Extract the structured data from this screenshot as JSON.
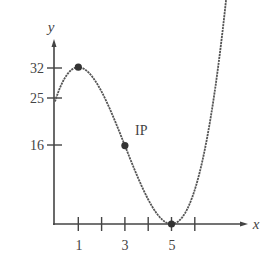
{
  "chart_data": {
    "type": "line",
    "title": "",
    "xlabel": "x",
    "ylabel": "y",
    "function": "f(x) = x^3 - 9x^2 + 15x + 25",
    "x_ticks": [
      1,
      2,
      3,
      4,
      5,
      6
    ],
    "x_tick_labels": [
      "1",
      "3",
      "5"
    ],
    "x_tick_label_values": [
      1,
      3,
      5
    ],
    "y_tick_labels": [
      "32",
      "25",
      "16"
    ],
    "y_tick_values": [
      32,
      25,
      16
    ],
    "xlim": [
      0,
      7.8
    ],
    "ylim": [
      0,
      37
    ],
    "grid": false,
    "legend": null,
    "series": [
      {
        "name": "f(x)",
        "x": [
          0,
          0.5,
          1,
          1.5,
          2,
          2.5,
          3,
          3.5,
          4,
          4.5,
          5,
          5.5,
          6,
          6.5,
          7,
          7.5
        ],
        "y": [
          25,
          30.375,
          32,
          30.625,
          27,
          21.875,
          16,
          10.125,
          5,
          1.375,
          0,
          1.625,
          7,
          16.875,
          32,
          53.125
        ]
      }
    ],
    "marked_points": [
      {
        "x": 1,
        "y": 32,
        "label": ""
      },
      {
        "x": 3,
        "y": 16,
        "label": "IP"
      },
      {
        "x": 5,
        "y": 0,
        "label": ""
      }
    ],
    "annotations": [
      {
        "text": "IP",
        "x": 3,
        "y": 16
      }
    ]
  },
  "labels": {
    "x_axis": "x",
    "y_axis": "y",
    "ip": "IP",
    "xt1": "1",
    "xt3": "3",
    "xt5": "5",
    "y32": "32",
    "y25": "25",
    "y16": "16"
  }
}
